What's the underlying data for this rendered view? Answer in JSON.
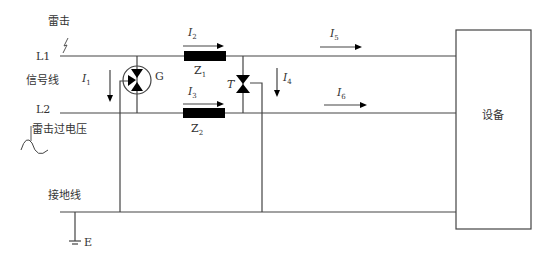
{
  "diagram": {
    "labels": {
      "lightning": "雷击",
      "L1": "L1",
      "signal_line": "信号线",
      "L2": "L2",
      "lightning_overvoltage": "雷击过电压",
      "ground_line": "接地线",
      "earth": "E",
      "G": "G",
      "T": "T",
      "device": "设备"
    },
    "currents": {
      "I1": {
        "base": "I",
        "sub": "1"
      },
      "I2": {
        "base": "I",
        "sub": "2"
      },
      "I3": {
        "base": "I",
        "sub": "3"
      },
      "I4": {
        "base": "I",
        "sub": "4"
      },
      "I5": {
        "base": "I",
        "sub": "5"
      },
      "I6": {
        "base": "I",
        "sub": "6"
      }
    },
    "impedances": {
      "Z1": {
        "base": "Z",
        "sub": "1"
      },
      "Z2": {
        "base": "Z",
        "sub": "2"
      }
    },
    "colors": {
      "line": "#444444",
      "fill": "#000000"
    }
  }
}
